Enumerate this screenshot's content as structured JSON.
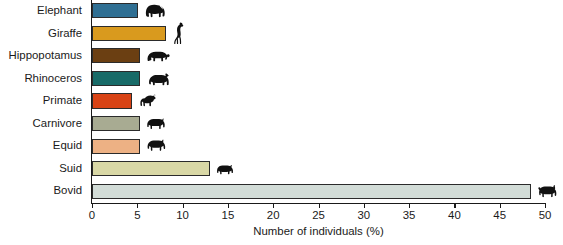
{
  "chart_data": {
    "type": "bar",
    "orientation": "horizontal",
    "title": "",
    "xlabel": "Number of individuals (%)",
    "ylabel": "",
    "xlim": [
      0,
      50
    ],
    "xticks": [
      0,
      5,
      10,
      15,
      20,
      25,
      30,
      35,
      40,
      45,
      50
    ],
    "xtick_labels": [
      "0",
      "5",
      "10",
      "15",
      "20",
      "25",
      "30",
      "35",
      "40",
      "45",
      "50"
    ],
    "grid": false,
    "legend": "none",
    "categories": [
      "Elephant",
      "Giraffe",
      "Hippopotamus",
      "Rhinoceros",
      "Primate",
      "Carnivore",
      "Equid",
      "Suid",
      "Bovid"
    ],
    "values": [
      5.1,
      8.2,
      5.3,
      5.3,
      4.4,
      5.3,
      5.3,
      13.0,
      48.4
    ],
    "bar_colors": [
      "#2f6f93",
      "#d99a1e",
      "#6b3f12",
      "#186b68",
      "#d84315",
      "#a8ab92",
      "#edb184",
      "#d9d8a6",
      "#d2dcd7"
    ],
    "bar_border_color": "#2b2b2b",
    "icons": [
      "elephant-icon",
      "giraffe-icon",
      "hippopotamus-icon",
      "rhinoceros-icon",
      "primate-icon",
      "carnivore-icon",
      "equid-icon",
      "suid-icon",
      "bovid-icon"
    ],
    "bars": [
      {
        "category": "Elephant",
        "value": 5.1,
        "color": "#2f6f93",
        "icon": "elephant-icon"
      },
      {
        "category": "Giraffe",
        "value": 8.2,
        "color": "#d99a1e",
        "icon": "giraffe-icon"
      },
      {
        "category": "Hippopotamus",
        "value": 5.3,
        "color": "#6b3f12",
        "icon": "hippopotamus-icon"
      },
      {
        "category": "Rhinoceros",
        "value": 5.3,
        "color": "#186b68",
        "icon": "rhinoceros-icon"
      },
      {
        "category": "Primate",
        "value": 4.4,
        "color": "#d84315",
        "icon": "primate-icon"
      },
      {
        "category": "Carnivore",
        "value": 5.3,
        "color": "#a8ab92",
        "icon": "carnivore-icon"
      },
      {
        "category": "Equid",
        "value": 5.3,
        "color": "#edb184",
        "icon": "equid-icon"
      },
      {
        "category": "Suid",
        "value": 13.0,
        "color": "#d9d8a6",
        "icon": "suid-icon"
      },
      {
        "category": "Bovid",
        "value": 48.4,
        "color": "#d2dcd7",
        "icon": "bovid-icon"
      }
    ]
  }
}
